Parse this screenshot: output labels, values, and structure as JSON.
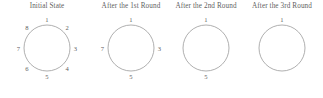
{
  "figure": {
    "background_color": "#ffffff",
    "stroke_color": "#9a9a9a",
    "text_color": "#5f5f5f",
    "panel_count": 4
  },
  "panels": [
    {
      "title": "Initial State",
      "labels": [
        {
          "text": "1",
          "angle_deg": 90,
          "position": "top"
        },
        {
          "text": "2",
          "angle_deg": 45,
          "position": "upper-right"
        },
        {
          "text": "3",
          "angle_deg": 0,
          "position": "right"
        },
        {
          "text": "4",
          "angle_deg": -45,
          "position": "lower-right"
        },
        {
          "text": "5",
          "angle_deg": -90,
          "position": "bottom"
        },
        {
          "text": "6",
          "angle_deg": -135,
          "position": "lower-left"
        },
        {
          "text": "7",
          "angle_deg": 180,
          "position": "left"
        },
        {
          "text": "8",
          "angle_deg": 135,
          "position": "upper-left"
        }
      ]
    },
    {
      "title": "After the 1st Round",
      "labels": [
        {
          "text": "1",
          "angle_deg": 90,
          "position": "top"
        },
        {
          "text": "3",
          "angle_deg": 0,
          "position": "right"
        },
        {
          "text": "5",
          "angle_deg": -90,
          "position": "bottom"
        },
        {
          "text": "7",
          "angle_deg": 180,
          "position": "left"
        }
      ]
    },
    {
      "title": "After the 2nd Round",
      "labels": [
        {
          "text": "1",
          "angle_deg": 90,
          "position": "top"
        },
        {
          "text": "5",
          "angle_deg": -90,
          "position": "bottom"
        }
      ]
    },
    {
      "title": "After the 3rd Round",
      "labels": [
        {
          "text": "1",
          "angle_deg": 90,
          "position": "top"
        }
      ]
    }
  ]
}
